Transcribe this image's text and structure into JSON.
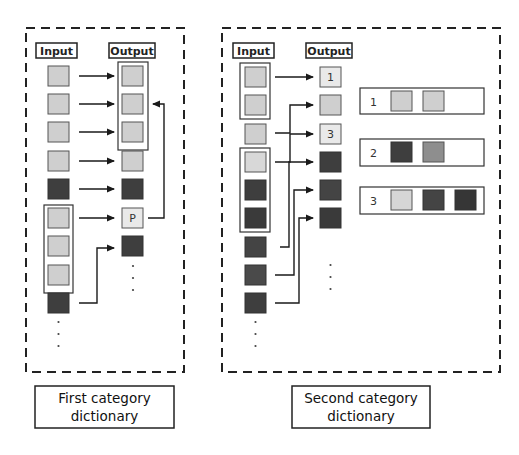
{
  "colors": {
    "light": "#cfcfcf",
    "medium": "#8e8e8e",
    "dark": "#3e3e3e",
    "stroke": "#2a2a2a",
    "paper": "#e9e9e9"
  },
  "first_panel": {
    "input_label": "Input",
    "output_label": "Output",
    "caption_line1": "First category",
    "caption_line2": "dictionary",
    "pointer_label": "P",
    "inputs": [
      "light",
      "light",
      "light",
      "light",
      "dark",
      "light",
      "light",
      "light",
      "dark"
    ],
    "outputs": [
      "light",
      "light",
      "light",
      "light",
      "dark",
      "P",
      "dark"
    ]
  },
  "second_panel": {
    "input_label": "Input",
    "output_label": "Output",
    "caption_line1": "Second category",
    "caption_line2": "dictionary",
    "inputs": [
      "light",
      "light",
      "light",
      "light",
      "dark",
      "dark",
      "dark",
      "dark",
      "dark"
    ],
    "outputs": [
      "1",
      "light",
      "3",
      "dark",
      "dark",
      "dark"
    ],
    "output_labels": {
      "0": "1",
      "2": "3"
    },
    "groups": [
      {
        "id": "1",
        "items": [
          "light",
          "light"
        ]
      },
      {
        "id": "2",
        "items": [
          "dark",
          "medium"
        ]
      },
      {
        "id": "3",
        "items": [
          "light",
          "dark",
          "dark"
        ]
      }
    ]
  },
  "ellipsis": "⋮"
}
